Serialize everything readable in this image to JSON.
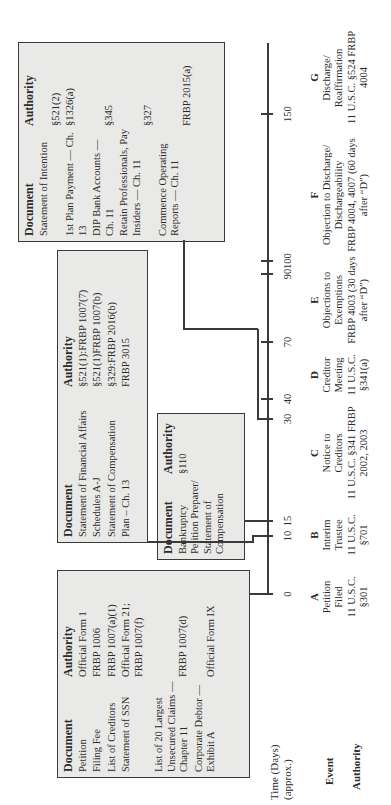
{
  "headers": {
    "document": "Document",
    "authority": "Authority"
  },
  "box_petition": {
    "rows": [
      {
        "doc": "Petition",
        "auth": "Official Form 1"
      },
      {
        "doc": "Filing Fee",
        "auth": "FRBP 1006"
      },
      {
        "doc": "List of Creditors",
        "auth": "FRBP 1007(a)(1)"
      },
      {
        "doc": "Statement of SSN",
        "auth": "Official Form 21; FRBP 1007(f)"
      },
      {
        "doc": "List of 20 Largest Unsecured Claims — Chapter 11",
        "auth": "FRBP 1007(d)"
      },
      {
        "doc": "Corporate Debtor — Exhibit A",
        "auth": "Official Form IX"
      }
    ]
  },
  "box_sofa": {
    "rows": [
      {
        "doc": "Statement of Financial Affairs",
        "auth": "§521(1):FRBP 1007(7)"
      },
      {
        "doc": "Schedules A-J",
        "auth": "§521(1)FRBP 1007(b)"
      },
      {
        "doc": "Statement of Compensation",
        "auth": "§329:FRBP 2016(b)"
      },
      {
        "doc": "Plan – Ch. 13",
        "auth": "FRBP 3015"
      }
    ]
  },
  "box_preparer": {
    "rows": [
      {
        "doc": "Bankruptcy Petition Preparer/ Statement of Compensation",
        "auth": "§110"
      }
    ]
  },
  "box_intention": {
    "rows": [
      {
        "doc": "Statement of Intention",
        "auth": "§521(2)"
      },
      {
        "doc": "1st Plan Payment — Ch. 13",
        "auth": "§1326(a)"
      },
      {
        "doc": "DIP Bank Accounts — Ch. 11",
        "auth": "§345"
      },
      {
        "doc": "Retain Professionals, Pay Insiders — Ch. 11",
        "auth": "§327"
      },
      {
        "doc": "Commence Operating Reports — Ch. 11",
        "auth": "FRBP 2015(a)"
      }
    ]
  },
  "timeline": {
    "label_line1": "Time (Days)",
    "label_line2": "(approx.)",
    "ticks": [
      "0",
      "10",
      "15",
      "30",
      "40",
      "70",
      "90",
      "100",
      "150"
    ]
  },
  "row_labels": {
    "event": "Event",
    "authority": "Authority"
  },
  "events": [
    {
      "letter": "A",
      "event": "Petition Filed",
      "authority": "11 U.S.C. §301"
    },
    {
      "letter": "B",
      "event": "Interim Trustee",
      "authority": "11 U.S.C. §701"
    },
    {
      "letter": "C",
      "event": "Notice to Creditors",
      "authority": "11 U.S.C. §341 FRBP 2002, 2003"
    },
    {
      "letter": "D",
      "event": "Creditor Meeting",
      "authority": "11 U.S.C. §341(a)"
    },
    {
      "letter": "E",
      "event": "Objections to Exemptions",
      "authority": "FRBP 4003 (30 days after “D”)"
    },
    {
      "letter": "F",
      "event": "Objection to Discharge/ Dischargeability",
      "authority": "FRBP 4004, 4007 (60 days after “D”)"
    },
    {
      "letter": "G",
      "event": "Discharge/ Reaffirmation",
      "authority": "11 U.S.C. §524 FRBP 4004"
    }
  ]
}
